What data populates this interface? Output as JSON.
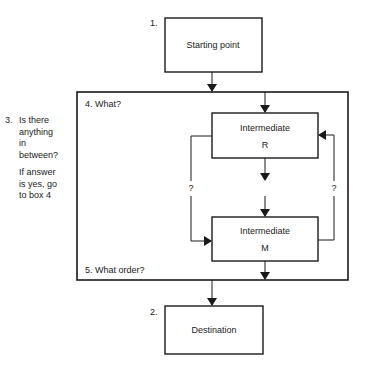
{
  "diagram": {
    "start": {
      "number": "1.",
      "label": "Starting point"
    },
    "destination": {
      "number": "2.",
      "label": "Destination"
    },
    "question": {
      "number": "3.",
      "text": "Is there anything in between?",
      "line1": "Is there",
      "line2": "anything",
      "line3": "in",
      "line4": "between?",
      "followup1": "If answer",
      "followup2": "is yes, go",
      "followup3": "to box 4"
    },
    "container": {
      "top_label": "4. What?",
      "bottom_label": "5. What order?"
    },
    "intermediate_r": {
      "title": "Intermediate",
      "letter": "R"
    },
    "intermediate_m": {
      "title": "Intermediate",
      "letter": "M"
    },
    "loop_left_label": "?",
    "loop_right_label": "?"
  }
}
